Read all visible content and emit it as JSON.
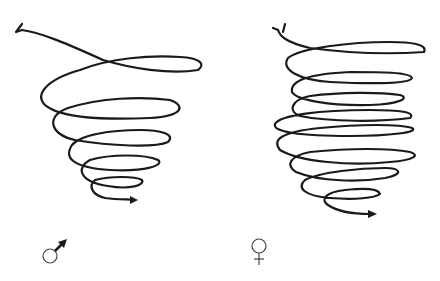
{
  "figure": {
    "panels": [
      {
        "id": "male",
        "symbol": "♂",
        "symbol_name": "male-symbol",
        "description": "Spiral flight path with wide loops narrowing downward, ending in arrow to the right"
      },
      {
        "id": "female",
        "symbol": "♀",
        "symbol_name": "female-symbol",
        "description": "Spiral flight path with tighter, more numerous loops narrowing downward, ending in arrow to the right"
      }
    ],
    "colors": {
      "line": "#1a1a1a",
      "background": "#ffffff"
    }
  }
}
